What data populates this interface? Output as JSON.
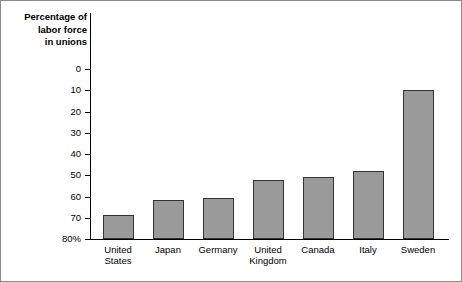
{
  "title": {
    "line1": "Percentage of",
    "line2": "labor force",
    "line3": "in unions"
  },
  "axis": {
    "y_ticks": [
      "80%",
      "70",
      "60",
      "50",
      "40",
      "30",
      "20",
      "10",
      "0"
    ]
  },
  "colors": {
    "bar_fill": "#9a9a9a",
    "bar_stroke": "#333333",
    "axis": "#000000",
    "frame": "#8a8a8a",
    "background": "#ffffff"
  },
  "chart_data": {
    "type": "bar",
    "title": "Percentage of labor force in unions",
    "xlabel": "",
    "ylabel": "Percentage of labor force in unions",
    "ylim": [
      0,
      80
    ],
    "ytick_values": [
      0,
      10,
      20,
      30,
      40,
      50,
      60,
      70,
      80
    ],
    "grid": false,
    "legend": "none",
    "categories": [
      "United States",
      "Japan",
      "Germany",
      "United Kingdom",
      "Canada",
      "Italy",
      "Sweden"
    ],
    "category_lines": [
      [
        "United",
        "States"
      ],
      [
        "Japan"
      ],
      [
        "Germany"
      ],
      [
        "United",
        "Kingdom"
      ],
      [
        "Canada"
      ],
      [
        "Italy"
      ],
      [
        "Sweden"
      ]
    ],
    "values": [
      11.5,
      18.5,
      19.5,
      28,
      29,
      32,
      70
    ],
    "value_unit": "%"
  }
}
